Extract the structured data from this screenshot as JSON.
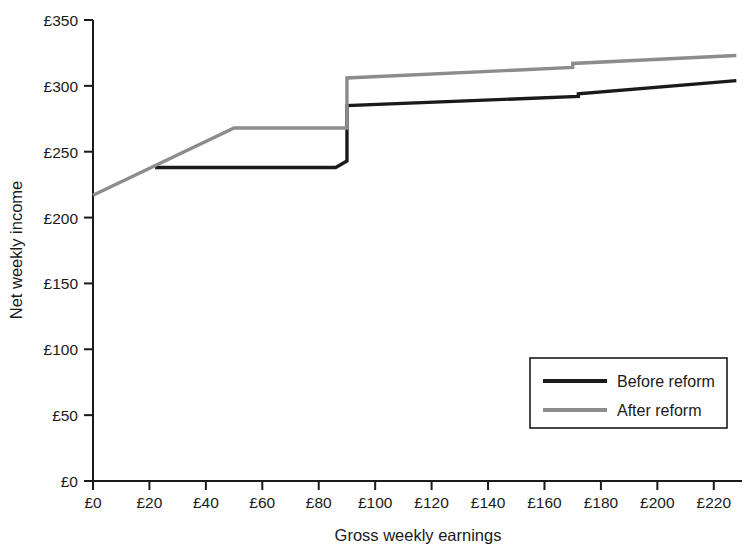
{
  "chart_data": {
    "type": "line",
    "title": "",
    "xlabel": "Gross weekly earnings",
    "ylabel": "Net weekly income",
    "xlim": [
      0,
      230
    ],
    "ylim": [
      0,
      350
    ],
    "grid": false,
    "legend_position": "bottom-right",
    "x_ticks": [
      0,
      20,
      40,
      60,
      80,
      100,
      120,
      140,
      160,
      180,
      200,
      220
    ],
    "x_tick_labels": [
      "£0",
      "£20",
      "£40",
      "£60",
      "£80",
      "£100",
      "£120",
      "£140",
      "£160",
      "£180",
      "£200",
      "£220"
    ],
    "y_ticks": [
      0,
      50,
      100,
      150,
      200,
      250,
      300,
      350
    ],
    "y_tick_labels": [
      "£0",
      "£50",
      "£100",
      "£150",
      "£200",
      "£250",
      "£300",
      "£350"
    ],
    "series": [
      {
        "name": "Before reform",
        "color": "#1a1a1a",
        "width": 3.4,
        "points": [
          [
            22,
            238
          ],
          [
            86,
            238
          ],
          [
            90,
            243
          ],
          [
            90,
            285
          ],
          [
            172,
            292
          ],
          [
            172,
            294
          ],
          [
            228,
            304
          ]
        ]
      },
      {
        "name": "After reform",
        "color": "#8c8c8c",
        "width": 3.4,
        "points": [
          [
            0,
            217
          ],
          [
            50,
            268
          ],
          [
            90,
            268
          ],
          [
            90,
            306
          ],
          [
            170,
            314
          ],
          [
            170,
            317
          ],
          [
            228,
            323
          ]
        ]
      }
    ],
    "annotations": []
  },
  "legend": {
    "entries": [
      {
        "label": "Before reform",
        "color": "#1a1a1a"
      },
      {
        "label": "After reform",
        "color": "#8c8c8c"
      }
    ]
  },
  "colors": {
    "axis": "#1a1a1a",
    "before": "#1a1a1a",
    "after": "#8c8c8c",
    "background": "#ffffff"
  }
}
